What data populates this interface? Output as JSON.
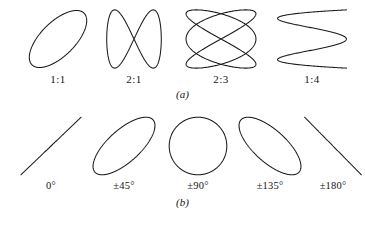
{
  "figure": {
    "background_color": "#ffffff",
    "stroke_color": "#1a1a1a",
    "width": 365,
    "height": 226
  },
  "panel_a": {
    "caption": "(a)",
    "cells": [
      {
        "label": "1:1",
        "name": "lissajous-1-1",
        "x": 23,
        "y": 8,
        "w": 70,
        "h": 62,
        "curve": {
          "fx": 1,
          "fy": 1,
          "phase_deg": 50,
          "rx": 0.82,
          "ry": 0.92
        }
      },
      {
        "label": "2:1",
        "name": "lissajous-2-1",
        "x": 103,
        "y": 8,
        "w": 62,
        "h": 62,
        "curve": {
          "fx": 1,
          "fy": 2,
          "phase_deg": 90,
          "rx": 0.88,
          "ry": 0.94
        }
      },
      {
        "label": "2:3",
        "name": "lissajous-2-3",
        "x": 183,
        "y": 8,
        "w": 76,
        "h": 62,
        "curve": {
          "fx": 3,
          "fy": 2,
          "phase_deg": 90,
          "rx": 0.92,
          "ry": 0.94
        }
      },
      {
        "label": "1:4",
        "name": "lissajous-1-4",
        "x": 275,
        "y": 8,
        "w": 74,
        "h": 62,
        "curve": {
          "fx": 4,
          "fy": 1,
          "phase_deg": 90,
          "rx": 0.93,
          "ry": 0.94
        }
      }
    ]
  },
  "panel_b": {
    "caption": "(b)",
    "cells": [
      {
        "label": "0°",
        "name": "phase-0",
        "x": 16,
        "y": 6,
        "w": 70,
        "h": 64,
        "curve": {
          "fx": 1,
          "fy": 1,
          "phase_deg": 0,
          "rx": 0.86,
          "ry": 0.9
        }
      },
      {
        "label": "±45°",
        "name": "phase-45",
        "x": 88,
        "y": 6,
        "w": 72,
        "h": 64,
        "curve": {
          "fx": 1,
          "fy": 1,
          "phase_deg": 45,
          "rx": 0.86,
          "ry": 0.9
        }
      },
      {
        "label": "±90°",
        "name": "phase-90",
        "x": 162,
        "y": 6,
        "w": 72,
        "h": 64,
        "curve": {
          "fx": 1,
          "fy": 1,
          "phase_deg": 90,
          "rx": 0.8,
          "ry": 0.9
        }
      },
      {
        "label": "±135°",
        "name": "phase-135",
        "x": 234,
        "y": 6,
        "w": 72,
        "h": 64,
        "curve": {
          "fx": 1,
          "fy": 1,
          "phase_deg": 135,
          "rx": 0.86,
          "ry": 0.9
        }
      },
      {
        "label": "±180°",
        "name": "phase-180",
        "x": 300,
        "y": 6,
        "w": 66,
        "h": 64,
        "curve": {
          "fx": 1,
          "fy": 1,
          "phase_deg": 180,
          "rx": 0.86,
          "ry": 0.9
        }
      }
    ]
  },
  "chart_data": {
    "type": "line",
    "panels": [
      {
        "id": "a",
        "caption": "(a)",
        "description": "Lissajous patterns for various frequency ratios",
        "categories": [
          "1:1",
          "2:1",
          "2:3",
          "1:4"
        ],
        "parameters": [
          {
            "ratio": "1:1",
            "fx": 1,
            "fy": 1,
            "phase_deg": 50
          },
          {
            "ratio": "2:1",
            "fx": 1,
            "fy": 2,
            "phase_deg": 90
          },
          {
            "ratio": "2:3",
            "fx": 3,
            "fy": 2,
            "phase_deg": 90
          },
          {
            "ratio": "1:4",
            "fx": 4,
            "fy": 1,
            "phase_deg": 90
          }
        ]
      },
      {
        "id": "b",
        "caption": "(b)",
        "description": "Lissajous patterns for equal frequencies at various phase differences",
        "categories": [
          "0°",
          "±45°",
          "±90°",
          "±135°",
          "±180°"
        ],
        "parameters": [
          {
            "phase": "0°",
            "fx": 1,
            "fy": 1,
            "phase_deg": 0
          },
          {
            "phase": "±45°",
            "fx": 1,
            "fy": 1,
            "phase_deg": 45
          },
          {
            "phase": "±90°",
            "fx": 1,
            "fy": 1,
            "phase_deg": 90
          },
          {
            "phase": "±135°",
            "fx": 1,
            "fy": 1,
            "phase_deg": 135
          },
          {
            "phase": "±180°",
            "fx": 1,
            "fy": 1,
            "phase_deg": 180
          }
        ]
      }
    ],
    "xlabel": "",
    "ylabel": "",
    "grid": false,
    "legend": "none"
  }
}
